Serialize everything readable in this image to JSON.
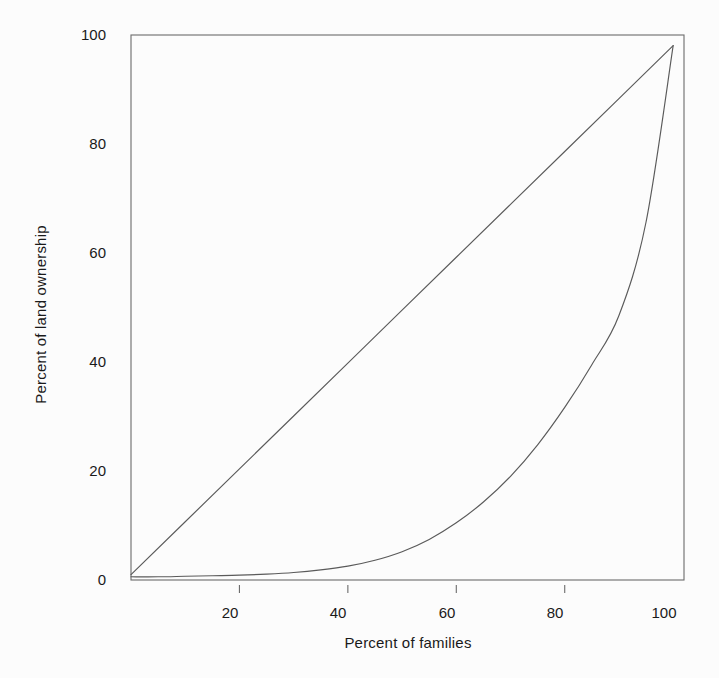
{
  "chart_data": {
    "type": "line",
    "title": "",
    "subtitle": "",
    "xlabel": "Percent of families",
    "ylabel": "Percent of land ownership",
    "xlim": [
      0,
      102
    ],
    "ylim": [
      0,
      102
    ],
    "grid": false,
    "legend": null,
    "legend_position": "none",
    "x_ticks": [
      20,
      40,
      60,
      80,
      100
    ],
    "x_tick_labels": [
      "20",
      "40",
      "60",
      "80",
      "100"
    ],
    "y_ticks": [
      0,
      20,
      40,
      60,
      80,
      100
    ],
    "y_tick_labels": [
      "0",
      "20",
      "40",
      "60",
      "80",
      "100"
    ],
    "series": [
      {
        "name": "Line of perfect equality",
        "style": "straight diagonal",
        "color": "#5a5a5a",
        "x": [
          0,
          10,
          20,
          30,
          40,
          50,
          60,
          70,
          80,
          90,
          100
        ],
        "values": [
          1,
          10.9,
          20.8,
          30.7,
          40.6,
          50.5,
          60.4,
          70.3,
          80.2,
          90.1,
          100
        ]
      },
      {
        "name": "Lorenz curve of land ownership",
        "style": "convex curve",
        "color": "#5a5a5a",
        "x": [
          0,
          5,
          10,
          15,
          20,
          25,
          30,
          35,
          40,
          45,
          50,
          55,
          60,
          65,
          70,
          75,
          80,
          85,
          90,
          95,
          100
        ],
        "values": [
          0.6,
          0.6,
          0.7,
          0.8,
          0.9,
          1.1,
          1.4,
          1.9,
          2.6,
          3.7,
          5.3,
          7.6,
          10.7,
          14.6,
          19.4,
          25.3,
          32.3,
          40.3,
          49.5,
          67.0,
          100
        ]
      }
    ],
    "annotations": []
  },
  "axes": {
    "y_axis_name": "y-axis",
    "x_axis_name": "x-axis"
  },
  "colors": {
    "background": "#fcfcfc",
    "frame": "#6b6b6b",
    "line": "#5a5a5a",
    "text": "#1a1a1a"
  }
}
